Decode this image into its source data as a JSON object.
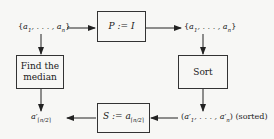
{
  "diagram": {
    "nodes": {
      "input_set": {
        "text": "{a₁, . . . , aₙ}"
      },
      "permute_box": {
        "text": "P := I"
      },
      "output_set": {
        "text": "{a₁, . . . , aₙ}"
      },
      "find_median_box": {
        "line1": "Find the",
        "line2": "median"
      },
      "sort_box": {
        "text": "Sort"
      },
      "median_result": {
        "text": "a′⌈n/2⌉"
      },
      "select_box": {
        "text": "S := a⌈n/2⌉"
      },
      "sorted_seq": {
        "text": "(a′₁, . . . , a′ₙ)",
        "suffix": "(sorted)"
      }
    },
    "edges": [
      {
        "from": "input_set",
        "to": "permute_box"
      },
      {
        "from": "permute_box",
        "to": "output_set"
      },
      {
        "from": "output_set",
        "to": "sort_box"
      },
      {
        "from": "sort_box",
        "to": "sorted_seq"
      },
      {
        "from": "sorted_seq",
        "to": "select_box"
      },
      {
        "from": "select_box",
        "to": "median_result"
      },
      {
        "from": "input_set",
        "to": "find_median_box"
      },
      {
        "from": "find_median_box",
        "to": "median_result"
      }
    ]
  }
}
